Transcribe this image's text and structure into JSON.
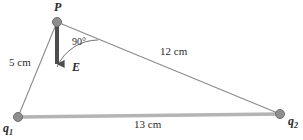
{
  "figure": {
    "type": "geometry-diagram",
    "width": 303,
    "height": 140,
    "background_color": "#ffffff"
  },
  "colors": {
    "thin_line": "#8a8a8a",
    "thick_line": "#b4b4b4",
    "vertex_dot": "#8f8f8f",
    "vertex_dot_stroke": "#6e6e6e",
    "field_arrow": "#4d4d4d",
    "arc": "#707070",
    "text": "#2b2b2b"
  },
  "vertices": [
    {
      "id": "P",
      "label": "P",
      "x": 57,
      "y": 22,
      "r": 4.5
    },
    {
      "id": "q1",
      "label": "q",
      "sub": "1",
      "x": 18,
      "y": 117,
      "r": 4.5
    },
    {
      "id": "q2",
      "label": "q",
      "sub": "2",
      "x": 280,
      "y": 114,
      "r": 4.5
    }
  ],
  "edges": [
    {
      "id": "P-q1",
      "from": "P",
      "to": "q1",
      "style": "thin",
      "length_label": "5 cm"
    },
    {
      "id": "P-q2",
      "from": "P",
      "to": "q2",
      "style": "thin",
      "length_label": "12 cm"
    },
    {
      "id": "q1-q2",
      "from": "q1",
      "to": "q2",
      "style": "thick",
      "length_label": "13 cm"
    }
  ],
  "field_arrow": {
    "label": "E",
    "from_x": 57,
    "from_y": 24,
    "to_x": 57,
    "to_y": 73,
    "direction": "down",
    "shaft_width": 4
  },
  "angle_marker": {
    "label": "90°",
    "vertex": "P",
    "between": [
      "field_arrow",
      "P-q2"
    ]
  },
  "labels": {
    "point_P": "P",
    "field_E": "E",
    "angle": "90°",
    "side_P_q1": "5 cm",
    "side_P_q2": "12 cm",
    "side_q1_q2": "13 cm",
    "charge_1_base": "q",
    "charge_1_sub": "1",
    "charge_2_base": "q",
    "charge_2_sub": "2"
  }
}
